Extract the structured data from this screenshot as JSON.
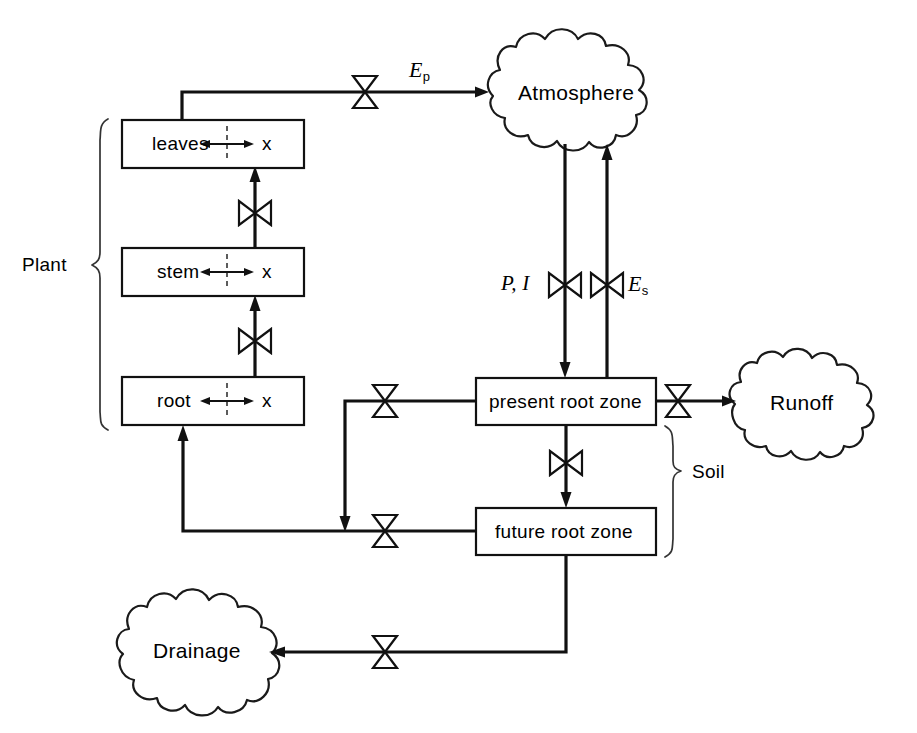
{
  "diagram": {
    "stroke_color": "#111111",
    "background_color": "#ffffff"
  },
  "boxes": [
    {
      "id": "leaves",
      "label": "leaves",
      "suffix": "x",
      "x": 122,
      "y": 120,
      "w": 182,
      "h": 48
    },
    {
      "id": "stem",
      "label": "stem",
      "suffix": "x",
      "x": 122,
      "y": 248,
      "w": 182,
      "h": 48
    },
    {
      "id": "root",
      "label": "root",
      "suffix": "x",
      "x": 122,
      "y": 377,
      "w": 182,
      "h": 48
    },
    {
      "id": "present-root-zone",
      "label": "present root zone",
      "suffix": "",
      "x": 476,
      "y": 378,
      "w": 180,
      "h": 47
    },
    {
      "id": "future-root-zone",
      "label": "future root zone",
      "suffix": "",
      "x": 476,
      "y": 508,
      "w": 180,
      "h": 47
    }
  ],
  "clouds": [
    {
      "id": "atmosphere",
      "label": "Atmosphere",
      "cx": 578,
      "cy": 92,
      "rx": 94,
      "ry": 58
    },
    {
      "id": "runoff",
      "label": "Runoff",
      "cx": 805,
      "cy": 402,
      "rx": 78,
      "ry": 50
    },
    {
      "id": "drainage",
      "label": "Drainage",
      "cx": 203,
      "cy": 651,
      "rx": 89,
      "ry": 52
    }
  ],
  "group_labels": [
    {
      "id": "plant",
      "label": "Plant",
      "x": 22,
      "y": 263
    },
    {
      "id": "soil",
      "label": "Soil",
      "x": 690,
      "y": 470
    }
  ],
  "flow_labels": [
    {
      "id": "Ep",
      "base": "E",
      "sub": "p",
      "prefix": "",
      "x": 410,
      "y": 62
    },
    {
      "id": "PI",
      "base": "",
      "sub": "",
      "prefix": "P, I",
      "x": 503,
      "y": 273
    },
    {
      "id": "Es",
      "base": "E",
      "sub": "s",
      "prefix": "",
      "x": 622,
      "y": 273
    }
  ],
  "valves": [
    {
      "id": "valve-ep",
      "x": 365,
      "y": 92,
      "orientation": "vertical"
    },
    {
      "id": "valve-stem-leaves",
      "x": 255,
      "y": 213,
      "orientation": "horizontal"
    },
    {
      "id": "valve-root-stem",
      "x": 255,
      "y": 341,
      "orientation": "horizontal"
    },
    {
      "id": "valve-precip",
      "x": 565,
      "y": 285,
      "orientation": "horizontal"
    },
    {
      "id": "valve-soil-evap",
      "x": 607,
      "y": 285,
      "orientation": "horizontal"
    },
    {
      "id": "valve-uptake-present",
      "x": 385,
      "y": 401,
      "orientation": "vertical"
    },
    {
      "id": "valve-runoff",
      "x": 678,
      "y": 401,
      "orientation": "vertical"
    },
    {
      "id": "valve-percolation",
      "x": 566,
      "y": 463,
      "orientation": "horizontal"
    },
    {
      "id": "valve-uptake-future",
      "x": 385,
      "y": 531,
      "orientation": "vertical"
    },
    {
      "id": "valve-drainage",
      "x": 385,
      "y": 652,
      "orientation": "vertical"
    }
  ],
  "flows": [
    {
      "id": "leaves-to-atmosphere",
      "from": "leaves",
      "to": "atmosphere"
    },
    {
      "id": "stem-to-leaves",
      "from": "stem",
      "to": "leaves"
    },
    {
      "id": "root-to-stem",
      "from": "root",
      "to": "stem"
    },
    {
      "id": "atmosphere-to-present",
      "from": "atmosphere",
      "to": "present-root-zone"
    },
    {
      "id": "present-to-atmosphere",
      "from": "present-root-zone",
      "to": "atmosphere"
    },
    {
      "id": "present-to-runoff",
      "from": "present-root-zone",
      "to": "runoff"
    },
    {
      "id": "present-to-future",
      "from": "present-root-zone",
      "to": "future-root-zone"
    },
    {
      "id": "present-to-root",
      "from": "present-root-zone",
      "to": "root"
    },
    {
      "id": "future-to-root",
      "from": "future-root-zone",
      "to": "root"
    },
    {
      "id": "future-to-drainage",
      "from": "future-root-zone",
      "to": "drainage"
    }
  ]
}
